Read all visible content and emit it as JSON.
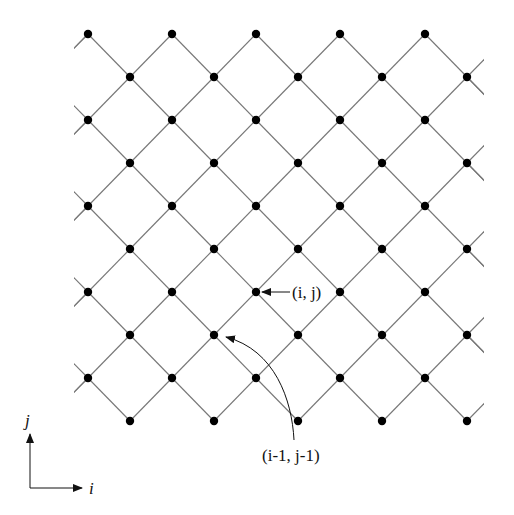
{
  "diagram": {
    "type": "diamond-lattice",
    "line_color": "#777777",
    "dot_color": "#000000",
    "dot_radius": 4.2,
    "row_y": [
      34,
      77,
      120,
      163,
      206,
      249,
      292,
      335,
      378,
      421
    ],
    "even_row_x": [
      88,
      172,
      256,
      340,
      425
    ],
    "odd_row_x": [
      130,
      214,
      298,
      382,
      467
    ],
    "clip": {
      "x0": 74,
      "x1": 484,
      "y0": 20,
      "y1": 430
    },
    "labels": {
      "point_ij": "(i, j)",
      "point_im1_jm1": "(i-1, j-1)",
      "axis_i": "i",
      "axis_j": "j"
    }
  }
}
